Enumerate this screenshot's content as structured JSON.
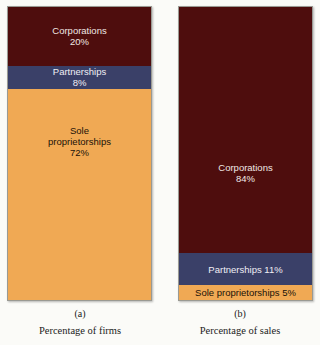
{
  "chart_data": {
    "type": "bar",
    "title": "",
    "subtitle": "",
    "xlabel": "",
    "ylabel": "",
    "ylim": [
      0,
      100
    ],
    "grid": false,
    "legend_position": "none",
    "orientation": "vertical-stacked",
    "note": "Two 100% stacked bars comparing business-form share of firms vs share of sales",
    "categories": [
      "Percentage of firms",
      "Percentage of sales"
    ],
    "series": [
      {
        "name": "Corporations",
        "values": [
          20,
          84
        ],
        "color": "#4e0d0d"
      },
      {
        "name": "Partnerships",
        "values": [
          8,
          11
        ],
        "color": "#3a4068"
      },
      {
        "name": "Sole proprietorships",
        "values": [
          72,
          5
        ],
        "color": "#f0a954"
      }
    ]
  },
  "colors": {
    "corporations": "#4e0d0d",
    "partnerships": "#3a4068",
    "sole_proprietorships": "#f0a954",
    "background": "#fbfbf8",
    "bar_border": "#9a9a93",
    "light_text": "#efe7e4",
    "dark_text": "#1a1208"
  },
  "panel_a": {
    "letter": "(a)",
    "caption": "Percentage of firms",
    "segments": {
      "corporations": {
        "name": "Corporations",
        "value": "20%",
        "label": "Corporations\n20%"
      },
      "partnerships": {
        "name": "Partnerships",
        "value": "8%",
        "label": "Partnerships\n8%"
      },
      "sole_proprietorships": {
        "name": "Sole proprietorships",
        "value": "72%",
        "label": "Sole\nproprietorships\n72%"
      }
    }
  },
  "panel_b": {
    "letter": "(b)",
    "caption": "Percentage of sales",
    "segments": {
      "corporations": {
        "name": "Corporations",
        "value": "84%",
        "label": "Corporations\n84%"
      },
      "partnerships": {
        "name": "Partnerships",
        "value": "11%",
        "label": "Partnerships 11%"
      },
      "sole_proprietorships": {
        "name": "Sole proprietorships",
        "value": "5%",
        "label": "Sole proprietorships 5%"
      }
    }
  }
}
